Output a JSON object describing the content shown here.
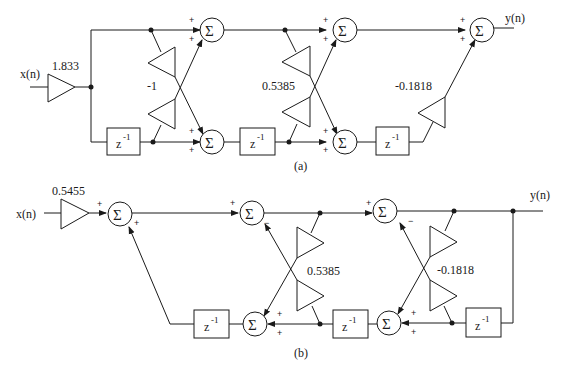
{
  "diagram_a": {
    "caption": "(a)",
    "input_label": "x(n)",
    "output_label": "y(n)",
    "input_gain": "1.833",
    "lattice_gains": [
      "-1",
      "0.5385",
      "-0.1818"
    ],
    "sum_symbol": "Σ",
    "delay": {
      "base": "z",
      "exp": "-1"
    },
    "plus": "+",
    "minus": "-"
  },
  "diagram_b": {
    "caption": "(b)",
    "input_label": "x(n)",
    "output_label": "y(n)",
    "input_gain": "0.5455",
    "lattice_gains": [
      "0.5385",
      "-0.1818"
    ],
    "sum_symbol": "Σ",
    "delay": {
      "base": "z",
      "exp": "-1"
    },
    "plus": "+",
    "minus": "−"
  }
}
